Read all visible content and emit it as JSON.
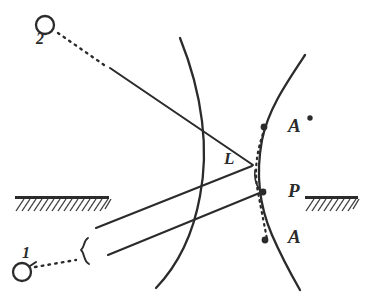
{
  "figure": {
    "background_color": "#ffffff",
    "ink_color": "#2b2b2b",
    "width": 373,
    "height": 301
  },
  "labels": {
    "source_2": "2",
    "source_1": "1",
    "lens_vertex": "L",
    "point_A_prime": "A",
    "point_A_prime_mark": "•",
    "point_P": "P",
    "point_A": "A"
  },
  "elements": {
    "source_2_marker": "open-circle",
    "source_1_marker": "open-circle",
    "dotted_ray_2": "dotted-line-from-source-2",
    "dotted_ray_1": "dotted-line-from-source-1",
    "beam_brace": "curly-brace",
    "left_wavefront": "arc-curve",
    "right_wavefront": "arc-curve",
    "chord_dotted": "dotted-vertical-chord",
    "hatched_barrier_left": "hatched-ground-bar",
    "hatched_barrier_right": "hatched-ground-bar"
  },
  "geometry": {
    "source_2_circle": {
      "cx": 45,
      "cy": 25,
      "r": 9
    },
    "source_1_circle": {
      "cx": 22,
      "cy": 272,
      "r": 9
    },
    "node_A_prime": {
      "x": 264,
      "y": 127
    },
    "node_P": {
      "x": 263,
      "y": 192
    },
    "node_A": {
      "x": 265,
      "y": 240
    },
    "prime_dot": {
      "x": 310,
      "y": 118
    },
    "left_wavefront_path": "M 180 38 C 203 95, 209 150, 200 196 C 193 235, 178 265, 156 288",
    "right_wavefront_path": "M 305 55 C 285 85, 268 110, 262 140 C 256 172, 259 205, 272 235 C 282 258, 292 276, 300 290",
    "ray_from_2_path": "M 110 68 L 253 165",
    "ray_1_upper_path": "M 96 228 L 252 166",
    "ray_1_lower_path": "M 108 255 L 262 192",
    "chord_path": "M 265 128 C 256 152, 254 172, 258 192 C 262 214, 265 228, 267 239",
    "dotted_ray_2_path": "M 58 33 L 108 67",
    "dotted_ray_1_path": "M 35 267 L 76 260",
    "brace_path": "M 87 239 C 82 241, 84 247, 81 250 C 84 253, 83 260, 88 262",
    "barrier_left": {
      "x": 15,
      "y": 196,
      "w": 94,
      "h": 15
    },
    "barrier_right": {
      "x": 305,
      "y": 196,
      "w": 53,
      "h": 15
    },
    "L_vertex": {
      "x": 253,
      "y": 165
    }
  },
  "style": {
    "ray_stroke_width": 2.1,
    "wave_stroke_width": 2.3,
    "hatch_spacing": 5.5
  }
}
